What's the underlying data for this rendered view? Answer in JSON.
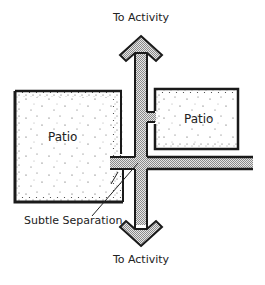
{
  "diagram": {
    "title": "",
    "labels": {
      "top_destination": "To Activity",
      "bottom_destination": "To Activity",
      "patio_left": "Patio",
      "patio_right": "Patio",
      "annotation": "Subtle Separation"
    },
    "elements": [
      {
        "type": "patio",
        "name": "left-patio",
        "label": "Patio"
      },
      {
        "type": "patio",
        "name": "right-patio",
        "label": "Patio"
      },
      {
        "type": "path",
        "name": "main-path-vertical",
        "direction": "both",
        "ends": [
          "To Activity",
          "To Activity"
        ]
      },
      {
        "type": "path",
        "name": "side-path-horizontal"
      },
      {
        "type": "path",
        "name": "connector-to-right-patio"
      },
      {
        "type": "annotation",
        "name": "subtle-separation",
        "text": "Subtle Separation"
      }
    ],
    "colors": {
      "stroke": "#1a1a1a",
      "path_fill": "#c8c8c8",
      "patio_stipple": "#3a3a3a",
      "background": "#ffffff",
      "text": "#222222"
    }
  }
}
